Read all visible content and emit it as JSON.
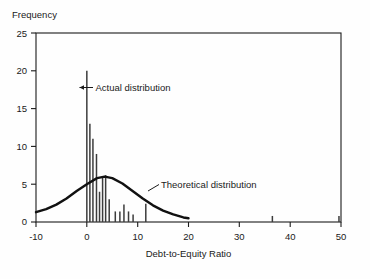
{
  "chart_data": {
    "type": "bar",
    "title": "",
    "xlabel": "Debt-to-Equity Ratio",
    "ylabel": "Frequency",
    "xlim": [
      -10,
      50
    ],
    "ylim": [
      0,
      25
    ],
    "xticks": [
      -10,
      0,
      10,
      20,
      30,
      40,
      50
    ],
    "xticklabels": [
      "-10",
      "0",
      "10",
      "20",
      "30",
      "40",
      "50"
    ],
    "yticks": [
      0,
      5,
      10,
      15,
      20,
      25
    ],
    "yticklabels": [
      "0",
      "5",
      "10",
      "15",
      "20",
      "25"
    ],
    "grid": false,
    "legend_position": "inline-annotation",
    "series": [
      {
        "name": "Actual distribution",
        "type": "bar",
        "x": [
          0.0,
          0.6,
          1.2,
          1.9,
          2.5,
          3.1,
          3.7,
          4.4,
          5.6,
          6.5,
          7.3,
          8.2,
          9.1,
          11.6,
          36.5,
          49.6
        ],
        "values": [
          20.0,
          13.0,
          11.0,
          9.0,
          4.0,
          6.0,
          6.2,
          3.0,
          1.4,
          1.4,
          2.3,
          1.4,
          1.0,
          2.4,
          0.8,
          0.8
        ]
      },
      {
        "name": "Theoretical distribution",
        "type": "line",
        "x": [
          -10,
          -8,
          -6,
          -4,
          -2,
          0,
          2,
          3.5,
          5,
          7,
          9,
          11,
          13,
          15,
          17,
          19,
          20
        ],
        "values": [
          1.3,
          1.7,
          2.3,
          3.1,
          4.1,
          5.0,
          5.8,
          6.0,
          5.8,
          5.1,
          4.1,
          3.1,
          2.2,
          1.5,
          1.0,
          0.6,
          0.5
        ]
      }
    ],
    "annotations": [
      {
        "text": "Actual distribution",
        "x": 0.0,
        "y": 18.0
      },
      {
        "text": "Theoretical distribution",
        "x": 14.0,
        "y": 5.2
      }
    ]
  },
  "axis": {
    "ylabel": "Frequency",
    "xlabel": "Debt-to-Equity Ratio"
  },
  "ticks": {
    "x": [
      "-10",
      "0",
      "10",
      "20",
      "30",
      "40",
      "50"
    ],
    "y": [
      "0",
      "5",
      "10",
      "15",
      "20",
      "25"
    ]
  },
  "annotations": {
    "actual": "Actual distribution",
    "theoretical": "Theoretical distribution"
  },
  "colors": {
    "axis": "#1a1a1a",
    "bar": "#3c3c3c",
    "curve": "#111111",
    "background": "#fefefe",
    "text": "#1a1a1a"
  }
}
